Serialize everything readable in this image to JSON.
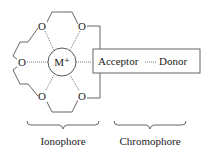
{
  "diagram": {
    "metal_ion": "M⁺",
    "oxygen_label": "O",
    "acceptor_label": "Acceptor",
    "donor_label": "Donor",
    "ionophore_label": "Ionophore",
    "chromophore_label": "Chromophore",
    "line_color": "#444444",
    "text_color": "#222222"
  }
}
